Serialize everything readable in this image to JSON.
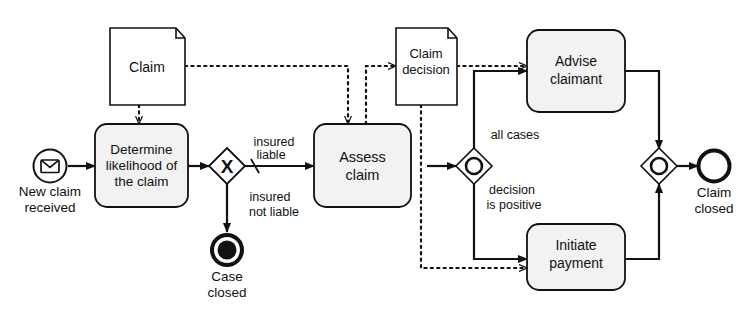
{
  "diagram": {
    "notation": "BPMN",
    "background_color": "#ffffff",
    "stroke_color": "#111111",
    "task_fill_color": "#f2f2f2",
    "data_object_fill_color": "#ffffff"
  },
  "events": {
    "start": {
      "id": "start-new-claim",
      "type": "message-start-event",
      "label": "New claim\nreceived",
      "label_line1": "New claim",
      "label_line2": "received",
      "icon": "envelope-icon"
    },
    "end_case_closed": {
      "id": "end-case-closed",
      "type": "terminate-end-event",
      "label_line1": "Case",
      "label_line2": "closed"
    },
    "end_claim_closed": {
      "id": "end-claim-closed",
      "type": "end-event",
      "label_line1": "Claim",
      "label_line2": "closed"
    }
  },
  "tasks": [
    {
      "id": "task-determine-likelihood",
      "line1": "Determine",
      "line2": "likelihood of",
      "line3": "the claim"
    },
    {
      "id": "task-assess-claim",
      "line1": "Assess",
      "line2": "claim",
      "line3": ""
    },
    {
      "id": "task-advise-claimant",
      "line1": "Advise",
      "line2": "claimant",
      "line3": ""
    },
    {
      "id": "task-initiate-payment",
      "line1": "Initiate",
      "line2": "payment",
      "line3": ""
    }
  ],
  "gateways": [
    {
      "id": "gateway-liability-xor",
      "type": "exclusive-gateway",
      "marker": "X"
    },
    {
      "id": "gateway-or-split",
      "type": "inclusive-gateway",
      "marker": "O"
    },
    {
      "id": "gateway-or-merge",
      "type": "inclusive-gateway",
      "marker": "O"
    }
  ],
  "data_objects": [
    {
      "id": "data-claim",
      "line1": "Claim",
      "line2": ""
    },
    {
      "id": "data-claim-decision",
      "line1": "Claim",
      "line2": "decision"
    }
  ],
  "flow_labels": {
    "insured_liable_line1": "insured",
    "insured_liable_line2": "liable",
    "insured_not_liable_line1": "insured",
    "insured_not_liable_line2": "not liable",
    "all_cases": "all cases",
    "decision_positive_line1": "decision",
    "decision_positive_line2": "is positive"
  }
}
